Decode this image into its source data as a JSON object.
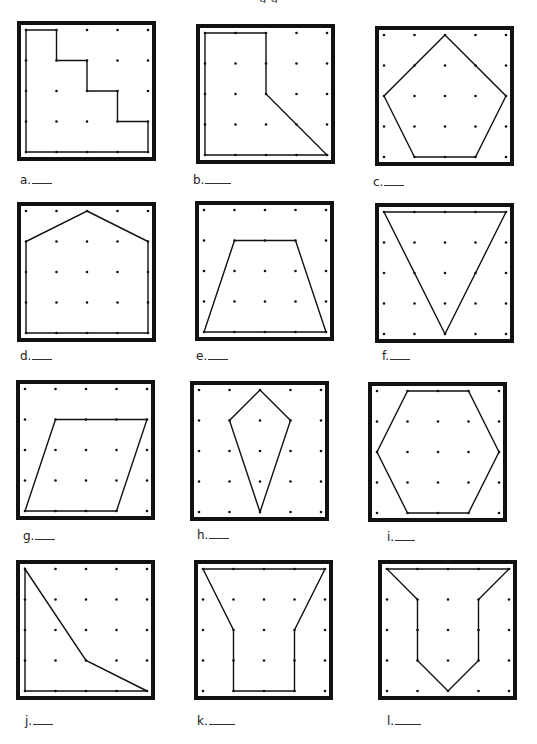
{
  "page": {
    "header_fragment": "g                    g"
  },
  "grid": {
    "cols": 5,
    "rows": 5
  },
  "colors": {
    "border": "#111111",
    "line": "#111111",
    "dot": "#111111",
    "background": "#ffffff"
  },
  "panels": [
    {
      "id": "a",
      "label": "a.",
      "box": [
        17,
        21
      ],
      "label_pos": [
        20,
        173
      ],
      "blank_width": 20,
      "shape": "staircase",
      "points": [
        [
          0,
          0
        ],
        [
          1,
          0
        ],
        [
          1,
          1
        ],
        [
          2,
          1
        ],
        [
          2,
          2
        ],
        [
          3,
          2
        ],
        [
          3,
          3
        ],
        [
          4,
          3
        ],
        [
          4,
          4
        ],
        [
          0,
          4
        ]
      ]
    },
    {
      "id": "b",
      "label": "b.",
      "box": [
        196,
        24
      ],
      "label_pos": [
        193,
        173
      ],
      "blank_width": 26,
      "shape": "pentagon-irregular",
      "points": [
        [
          0,
          0
        ],
        [
          2,
          0
        ],
        [
          2,
          2
        ],
        [
          4,
          4
        ],
        [
          0,
          4
        ]
      ]
    },
    {
      "id": "c",
      "label": "c.",
      "box": [
        375,
        26
      ],
      "label_pos": [
        373,
        175
      ],
      "blank_width": 20,
      "shape": "pentagon",
      "points": [
        [
          2,
          0
        ],
        [
          4,
          2
        ],
        [
          3,
          4
        ],
        [
          1,
          4
        ],
        [
          0,
          2
        ]
      ]
    },
    {
      "id": "d",
      "label": "d.",
      "box": [
        17,
        202
      ],
      "label_pos": [
        20,
        349
      ],
      "blank_width": 20,
      "shape": "house-pentagon",
      "points": [
        [
          2,
          0
        ],
        [
          4,
          1
        ],
        [
          4,
          4
        ],
        [
          0,
          4
        ],
        [
          0,
          1
        ]
      ]
    },
    {
      "id": "e",
      "label": "e.",
      "box": [
        195,
        201
      ],
      "label_pos": [
        196,
        349
      ],
      "blank_width": 20,
      "shape": "trapezoid",
      "points": [
        [
          1,
          1
        ],
        [
          3,
          1
        ],
        [
          4,
          4
        ],
        [
          0,
          4
        ]
      ]
    },
    {
      "id": "f",
      "label": "f.",
      "box": [
        375,
        203
      ],
      "label_pos": [
        382,
        349
      ],
      "blank_width": 20,
      "shape": "triangle",
      "points": [
        [
          0,
          0
        ],
        [
          4,
          0
        ],
        [
          2,
          4
        ]
      ]
    },
    {
      "id": "g",
      "label": "g.",
      "box": [
        16,
        380
      ],
      "label_pos": [
        23,
        529
      ],
      "blank_width": 20,
      "shape": "parallelogram",
      "points": [
        [
          1,
          1
        ],
        [
          4,
          1
        ],
        [
          3,
          4
        ],
        [
          0,
          4
        ]
      ]
    },
    {
      "id": "h",
      "label": "h.",
      "box": [
        190,
        381
      ],
      "label_pos": [
        197,
        528
      ],
      "blank_width": 20,
      "shape": "kite",
      "points": [
        [
          2,
          0
        ],
        [
          3,
          1
        ],
        [
          2,
          4
        ],
        [
          1,
          1
        ]
      ]
    },
    {
      "id": "i",
      "label": "i.",
      "box": [
        368,
        382
      ],
      "label_pos": [
        387,
        530
      ],
      "blank_width": 20,
      "shape": "hexagon",
      "points": [
        [
          1,
          0
        ],
        [
          3,
          0
        ],
        [
          4,
          2
        ],
        [
          3,
          4
        ],
        [
          1,
          4
        ],
        [
          0,
          2
        ]
      ]
    },
    {
      "id": "j",
      "label": "j.",
      "box": [
        16,
        560
      ],
      "label_pos": [
        25,
        714
      ],
      "blank_width": 20,
      "shape": "quadrilateral",
      "points": [
        [
          0,
          0
        ],
        [
          2,
          3
        ],
        [
          4,
          4
        ],
        [
          0,
          4
        ]
      ]
    },
    {
      "id": "k",
      "label": "k.",
      "box": [
        194,
        560
      ],
      "label_pos": [
        197,
        714
      ],
      "blank_width": 26,
      "shape": "hexagon-concave",
      "points": [
        [
          0,
          0
        ],
        [
          4,
          0
        ],
        [
          3,
          2
        ],
        [
          3,
          4
        ],
        [
          1,
          4
        ],
        [
          1,
          2
        ]
      ]
    },
    {
      "id": "l",
      "label": "l.",
      "box": [
        378,
        560
      ],
      "label_pos": [
        387,
        714
      ],
      "blank_width": 26,
      "shape": "heptagon-concave",
      "points": [
        [
          0,
          0
        ],
        [
          4,
          0
        ],
        [
          3,
          1
        ],
        [
          3,
          3
        ],
        [
          2,
          4
        ],
        [
          1,
          3
        ],
        [
          1,
          1
        ]
      ]
    }
  ]
}
